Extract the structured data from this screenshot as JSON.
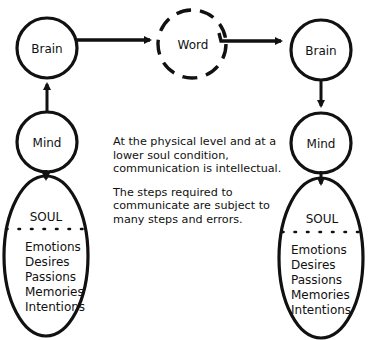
{
  "diagram": {
    "nodes": {
      "left_brain": "Brain",
      "left_mind": "Mind",
      "word": "Word",
      "right_brain": "Brain",
      "right_mind": "Mind"
    },
    "left_soul": {
      "title": "SOUL",
      "items": [
        "Emotions",
        "Desires",
        "Passions",
        "Memories",
        "Intentions"
      ]
    },
    "right_soul": {
      "title": "SOUL",
      "items": [
        "Emotions",
        "Desires",
        "Passions",
        "Memories",
        "Intentions"
      ]
    },
    "text": {
      "paragraph1": "At the physical level and at a lower soul condition, communication is intellectual.",
      "paragraph2": "The steps required to communicate are subject to many steps and errors."
    },
    "colors": {
      "stroke": "#111111",
      "background": "#ffffff"
    }
  }
}
